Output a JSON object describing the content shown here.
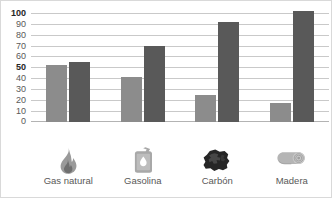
{
  "chart_data": {
    "type": "bar",
    "title": "",
    "subtitle": "",
    "xlabel": "",
    "ylabel": "",
    "categories": [
      "Gas natural",
      "Gasolina",
      "Carbón",
      "Madera"
    ],
    "series": [
      {
        "name": "serie-clara",
        "color": "#8c8c8c",
        "values": [
          52,
          41,
          24,
          17
        ]
      },
      {
        "name": "serie-oscura",
        "color": "#595959",
        "values": [
          55,
          70,
          92,
          102
        ]
      }
    ],
    "ylim": [
      0,
      100
    ],
    "ytick_step": 10,
    "yticks": [
      {
        "value": 100,
        "label": "100",
        "bold": true
      },
      {
        "value": 90,
        "label": "90",
        "bold": false
      },
      {
        "value": 80,
        "label": "80",
        "bold": false
      },
      {
        "value": 70,
        "label": "70",
        "bold": false
      },
      {
        "value": 60,
        "label": "60",
        "bold": false
      },
      {
        "value": 50,
        "label": "50",
        "bold": true
      },
      {
        "value": 40,
        "label": "40",
        "bold": false
      },
      {
        "value": 30,
        "label": "30",
        "bold": false
      },
      {
        "value": 20,
        "label": "20",
        "bold": false
      },
      {
        "value": 10,
        "label": "10",
        "bold": false
      },
      {
        "value": 0,
        "label": "0",
        "bold": false
      }
    ],
    "grid": true,
    "grid_color": "#c9c9c9",
    "legend": "none",
    "legend_position": "none",
    "annotations": [],
    "category_icons": [
      "flame-icon",
      "jerrycan-icon",
      "coal-icon",
      "log-icon"
    ],
    "colors": {
      "series_light": "#8c8c8c",
      "series_dark": "#595959",
      "background": "#ffffff",
      "border": "#d9d9d9",
      "tick_text": "#595959",
      "tick_text_bold": "#262626"
    }
  }
}
